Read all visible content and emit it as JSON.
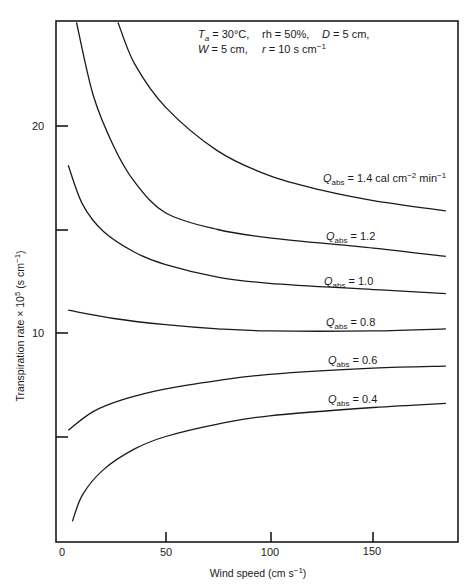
{
  "chart_data": {
    "type": "line",
    "title": "",
    "xlabel": "Wind speed (cm s⁻¹)",
    "ylabel": "Transpiration rate × 10⁵ (s cm⁻¹)",
    "xlim": [
      0,
      190
    ],
    "ylim": [
      0,
      25
    ],
    "x_ticks": [
      0,
      50,
      100,
      150
    ],
    "x_tick_labels": [
      "0",
      "50",
      "100",
      "150"
    ],
    "y_ticks": [
      5,
      10,
      15,
      20
    ],
    "y_tick_labels": [
      "",
      "10",
      "",
      "20"
    ],
    "grid": false,
    "legend": "inline labels at right end of each curve",
    "annotation": {
      "line1": [
        "T_a = 30°C,",
        "rh = 50%,",
        "D = 5 cm,"
      ],
      "line2": [
        "W = 5 cm,",
        "r = 10 s cm⁻¹"
      ]
    },
    "series": [
      {
        "name": "Q_abs = 1.4 cal cm⁻² min⁻¹",
        "q": 1.4,
        "x": [
          27,
          35,
          50,
          75,
          100,
          125,
          150,
          185
        ],
        "y": [
          25,
          23.0,
          20.9,
          18.8,
          17.6,
          16.9,
          16.4,
          15.9
        ]
      },
      {
        "name": "Q_abs = 1.2",
        "q": 1.2,
        "x": [
          7,
          15,
          25,
          35,
          50,
          75,
          100,
          150,
          185
        ],
        "y": [
          25,
          21.5,
          19.0,
          17.3,
          15.8,
          15.0,
          14.6,
          14.1,
          13.7
        ]
      },
      {
        "name": "Q_abs = 1.0",
        "q": 1.0,
        "x": [
          3,
          10,
          20,
          35,
          50,
          75,
          100,
          150,
          185
        ],
        "y": [
          18.1,
          16.2,
          14.9,
          13.9,
          13.3,
          12.7,
          12.4,
          12.1,
          11.9
        ]
      },
      {
        "name": "Q_abs = 0.8",
        "q": 0.8,
        "x": [
          3,
          25,
          50,
          75,
          100,
          150,
          185
        ],
        "y": [
          11.1,
          10.7,
          10.4,
          10.2,
          10.1,
          10.1,
          10.2
        ]
      },
      {
        "name": "Q_abs = 0.6",
        "q": 0.6,
        "x": [
          3,
          15,
          30,
          50,
          75,
          100,
          150,
          185
        ],
        "y": [
          5.3,
          6.2,
          6.8,
          7.3,
          7.7,
          8.0,
          8.3,
          8.4
        ]
      },
      {
        "name": "Q_abs = 0.4",
        "q": 0.4,
        "x": [
          5,
          10,
          20,
          35,
          50,
          75,
          100,
          150,
          185
        ],
        "y": [
          0.9,
          2.2,
          3.4,
          4.4,
          5.0,
          5.6,
          6.0,
          6.4,
          6.6
        ]
      }
    ]
  },
  "labels": {
    "x_axis": "Wind speed (cm s",
    "x_axis_sup": "−1",
    "x_axis_end": ")",
    "y_axis": "Transpiration rate × 10",
    "y_axis_sup5": "5",
    "y_axis_mid": " (s cm",
    "y_axis_sup": "−1",
    "y_axis_end": ")",
    "ann_ta": "T",
    "ann_ta_sub": "a",
    "ann_ta_val": " = 30°C,",
    "ann_rh": "rh = 50%,",
    "ann_d": "D",
    "ann_d_val": " = 5 cm,",
    "ann_w": "W",
    "ann_w_val": " = 5 cm,",
    "ann_r": "r",
    "ann_r_val": " = 10 s cm",
    "ann_r_sup": "−1",
    "q": "Q",
    "q_sub": "abs",
    "q14_val": " = 1.4 cal cm",
    "q14_sup1": "−2",
    "q14_mid": " min",
    "q14_sup2": "−1",
    "q12_val": " = 1.2",
    "q10_val": " = 1.0",
    "q08_val": " = 0.8",
    "q06_val": " = 0.6",
    "q04_val": " = 0.4"
  }
}
